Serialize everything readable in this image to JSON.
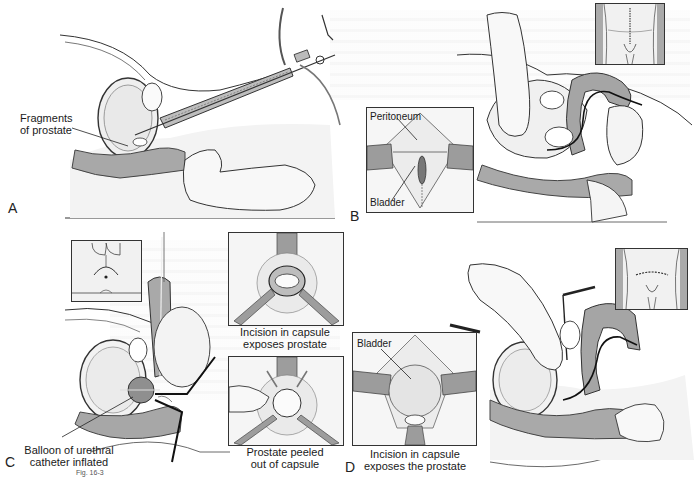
{
  "figure": {
    "caption_fragment": "Fig. 16-3",
    "background": "#ffffff",
    "ink_color": "#1a1a1a",
    "tissue_gray": "#9a9a9a",
    "light_gray": "#d6d6d6"
  },
  "panels": [
    {
      "id": "A",
      "letter": "A",
      "description": "Transurethral resection with resectoscope",
      "labels": [
        {
          "text_line1": "Fragments",
          "text_line2": "of prostate"
        }
      ]
    },
    {
      "id": "B",
      "letter": "B",
      "description": "Suprapubic approach with finger enucleation",
      "inset_labels": {
        "top": "Peritoneum",
        "bottom": "Bladder"
      },
      "body_inset": "lower-abdomen-vertical-incision"
    },
    {
      "id": "C",
      "letter": "C",
      "description": "Perineal approach",
      "labels": [
        {
          "text_line1": "Balloon of urethral",
          "text_line2": "catheter inflated"
        }
      ],
      "inset_top_caption": {
        "line1": "Incision in capsule",
        "line2": "exposes prostate"
      },
      "inset_bottom_caption": {
        "line1": "Prostate peeled",
        "line2": "out of capsule"
      },
      "body_inset": "perineum-curved-incision"
    },
    {
      "id": "D",
      "letter": "D",
      "description": "Retropubic approach",
      "inset_labels": {
        "top": "Bladder"
      },
      "inset_caption": {
        "line1": "Incision in capsule",
        "line2": "exposes the prostate"
      },
      "body_inset": "lower-abdomen-transverse-incision"
    }
  ]
}
